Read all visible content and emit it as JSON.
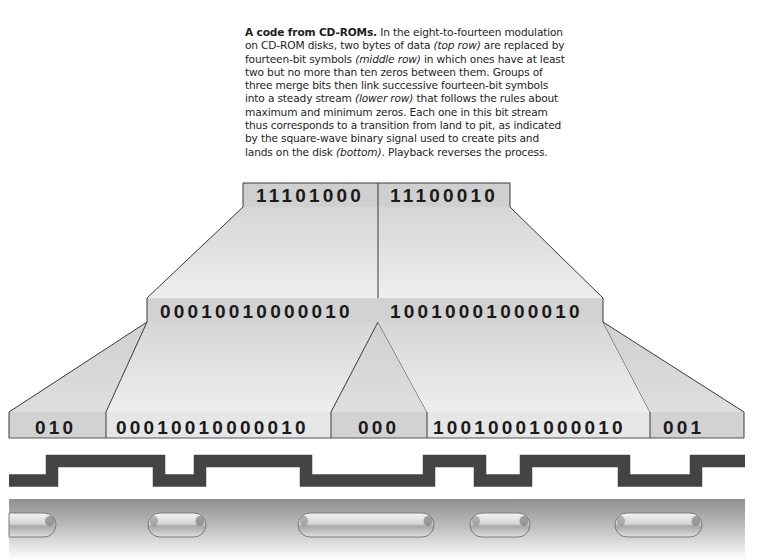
{
  "caption": {
    "lead": "A code from CD-ROMs.",
    "t1": " In the eight-to-fourteen modulation on CD-ROM disks, two bytes of data ",
    "top_row": "(top row)",
    "t2": " are replaced by fourteen-bit symbols ",
    "middle_row": "(middle row)",
    "t3": " in which ones have at least two but no more than ten zeros between them. Groups of three merge bits then link successive fourteen-bit symbols into a steady stream ",
    "lower_row": "(lower row)",
    "t4": " that follows the rules about maximum and minimum zeros. Each one in this bit stream thus corresponds to a transition from land to pit, as indicated by the square-wave binary signal used to create pits and lands on the disk ",
    "bottom": "(bottom)",
    "t5": ". Playback reverses the process."
  },
  "rows": {
    "top": [
      "11101000",
      "11100010"
    ],
    "middle": [
      "00010010000010",
      "10010001000010"
    ],
    "lower": [
      "010",
      "00010010000010",
      "000",
      "10010001000010",
      "001"
    ]
  },
  "signal": {
    "label": "square-wave binary signal",
    "transitions_x": [
      52,
      159,
      200,
      306,
      429,
      480,
      526,
      624,
      696
    ]
  },
  "disk": {
    "label": "pits and lands",
    "pits": [
      {
        "x1": 9,
        "x2": 57
      },
      {
        "x1": 148,
        "x2": 206
      },
      {
        "x1": 298,
        "x2": 434
      },
      {
        "x1": 470,
        "x2": 530
      },
      {
        "x1": 615,
        "x2": 702
      }
    ]
  },
  "colors": {
    "band": "#c9c9c9",
    "panel": "#e4e4e4",
    "outline": "#3a3a3a",
    "signal": "#444444",
    "disk_top": "#8f8f8f"
  }
}
